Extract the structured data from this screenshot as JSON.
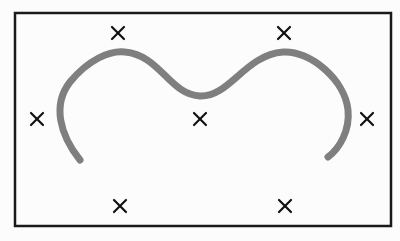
{
  "diagram": {
    "background": "#fcfcfc",
    "frame": {
      "x": 15,
      "y": 13,
      "width": 376,
      "height": 213,
      "stroke": "#1a1a1a",
      "stroke_width": 2.5
    },
    "curve": {
      "stroke": "#7f7f7f",
      "stroke_width": 7,
      "path": "M 80 160 C 60 135, 52 105, 70 82 C 88 60, 110 50, 125 52 C 160 55, 170 95, 200 96 C 230 97, 245 55, 283 52 C 310 50, 345 80, 348 110 C 350 130, 340 148, 328 157"
    },
    "markers": {
      "symbol": "cross",
      "color": "#111111",
      "size": 12,
      "points": [
        {
          "id": "top-left",
          "x": 118,
          "y": 33
        },
        {
          "id": "top-right",
          "x": 284,
          "y": 33
        },
        {
          "id": "middle-left",
          "x": 37,
          "y": 119
        },
        {
          "id": "middle-center",
          "x": 200,
          "y": 119
        },
        {
          "id": "middle-right",
          "x": 367,
          "y": 119
        },
        {
          "id": "bottom-left",
          "x": 120,
          "y": 206
        },
        {
          "id": "bottom-right",
          "x": 285,
          "y": 206
        }
      ]
    }
  }
}
